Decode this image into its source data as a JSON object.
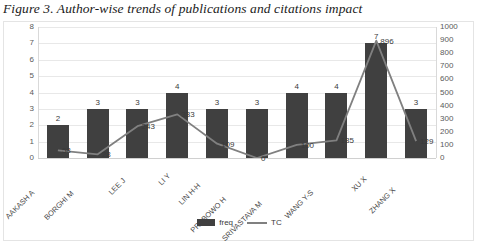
{
  "caption": "Figure 3. Author-wise trends of publications and citations impact",
  "legend": {
    "items": [
      {
        "label": "freq",
        "marker": "bar-swatch",
        "color": "#404040"
      },
      {
        "label": "TC",
        "marker": "line-swatch",
        "color": "#808080"
      }
    ],
    "position": "bottom-center"
  },
  "colors": {
    "bar": "#404040",
    "line": "#808080",
    "grid": "#e8e8e8",
    "axis": "#d0d0d0",
    "text": "#3a3a3a",
    "background": "#ffffff"
  },
  "chart_data": {
    "type": "bar",
    "title": "Figure 3. Author-wise trends of publications and citations impact",
    "xlabel": "",
    "ylabel": "",
    "grid": true,
    "categories": [
      "AAKASH A",
      "BORGHI M",
      "LEE J",
      "LI Y",
      "LIN H-H",
      "PRABOWO H",
      "SRIVASTAVA M",
      "WANG Y-S",
      "XU X",
      "ZHANG X"
    ],
    "series": [
      {
        "name": "freq",
        "type": "bar",
        "axis": "left",
        "values": [
          2,
          3,
          3,
          4,
          3,
          3,
          4,
          4,
          7,
          3
        ]
      },
      {
        "name": "TC",
        "type": "line",
        "axis": "right",
        "values": [
          58,
          28,
          243,
          333,
          109,
          0,
          100,
          135,
          896,
          129
        ]
      }
    ],
    "ylim": [
      0,
      8
    ],
    "ylim_secondary": [
      0,
      1000
    ],
    "yticks": [
      0,
      1,
      2,
      3,
      4,
      5,
      6,
      7,
      8
    ],
    "yticks_secondary": [
      0,
      100,
      200,
      300,
      400,
      500,
      600,
      700,
      800,
      900,
      1000
    ]
  }
}
